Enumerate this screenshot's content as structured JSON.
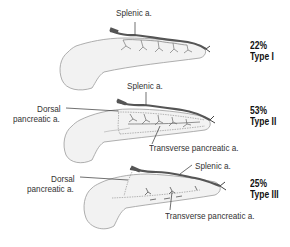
{
  "figure": {
    "colors": {
      "organ_fill": "#f2f2f2",
      "organ_outline": "#9a9a9a",
      "artery": "#555555",
      "text": "#333333"
    },
    "panels": [
      {
        "id": "type-1",
        "percent": "22%",
        "type_label": "Type I",
        "labels": {
          "splenic": "Splenic a."
        }
      },
      {
        "id": "type-2",
        "percent": "53%",
        "type_label": "Type II",
        "labels": {
          "splenic": "Splenic a.",
          "dorsal_line1": "Dorsal",
          "dorsal_line2": "pancreatic a.",
          "transverse": "Transverse pancreatic a."
        }
      },
      {
        "id": "type-3",
        "percent": "25%",
        "type_label": "Type III",
        "labels": {
          "splenic": "Splenic a.",
          "dorsal_line1": "Dorsal",
          "dorsal_line2": "pancreatic a.",
          "transverse": "Transverse pancreatic a."
        }
      }
    ]
  }
}
